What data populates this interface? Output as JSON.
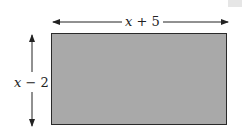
{
  "diagram": {
    "type": "rectangle-dimensions",
    "shape": {
      "name": "rectangle",
      "fill_color": "#a9a9a9",
      "border_color": "#2a2a2a"
    },
    "width_label": {
      "variable": "x",
      "operator": "+",
      "constant": "5",
      "text": "x + 5"
    },
    "height_label": {
      "variable": "x",
      "operator": "−",
      "constant": "2",
      "text": "x − 2"
    },
    "arrow_color": "#222222"
  }
}
